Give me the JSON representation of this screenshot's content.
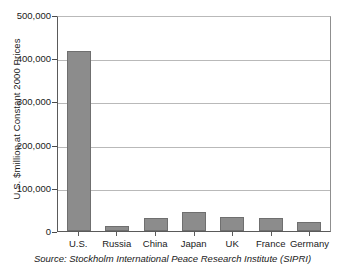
{
  "chart_data": {
    "type": "bar",
    "title": "",
    "subtitle": "",
    "xlabel": "",
    "ylabel": "U.S. $million at Constant 2000 Prices",
    "categories": [
      "U.S.",
      "Russia",
      "China",
      "Japan",
      "UK",
      "France",
      "Germany"
    ],
    "values": [
      417000,
      12000,
      30000,
      43000,
      33000,
      30000,
      21000
    ],
    "ylim": [
      0,
      500000
    ],
    "ytick_values": [
      0,
      100000,
      200000,
      300000,
      400000,
      500000
    ],
    "ytick_labels": [
      "0",
      "100,000",
      "200,000",
      "300,000",
      "400,000",
      "500,000"
    ],
    "grid": true,
    "legend": false,
    "legend_position": "none",
    "bar_color": "#8c8c8c",
    "bar_edge_color": "#6f6f6f",
    "plot_background": "#ffffff",
    "gridline_color": "#b9b9b9",
    "axis_color": "#5a5a5a",
    "annotations": [
      "Source: Stockholm International Peace Research Institute (SIPRI)"
    ]
  },
  "figure": {
    "source_note": "Source: Stockholm International Peace Research Institute (SIPRI)"
  }
}
